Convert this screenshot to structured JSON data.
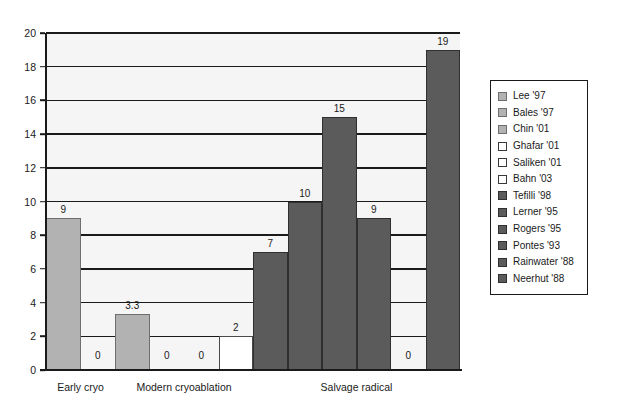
{
  "chart_data": {
    "type": "bar",
    "title": "",
    "subtitle": "",
    "xlabel": "",
    "ylabel": "",
    "ylim": [
      0,
      20
    ],
    "ytick_step": 2,
    "yticks": [
      "0",
      "2",
      "4",
      "6",
      "8",
      "10",
      "12",
      "14",
      "16",
      "18",
      "20"
    ],
    "grid": true,
    "grid_axis": "y",
    "legend_position": "right-outside",
    "categories": [
      "Early cryo",
      "Modern cryoablation",
      "Salvage radical"
    ],
    "category_spans": [
      {
        "label": "Early cryo",
        "bars": [
          0,
          1
        ]
      },
      {
        "label": "Modern cryoablation",
        "bars": [
          2,
          3,
          4,
          5
        ]
      },
      {
        "label": "Salvage radical",
        "bars": [
          6,
          7,
          8,
          9,
          10,
          11
        ]
      }
    ],
    "bars": [
      {
        "label": "Lee '97",
        "value": 9,
        "value_label": "9",
        "group": "Early cryo",
        "shade": "light"
      },
      {
        "label": "Bales '97",
        "value": 0,
        "value_label": "0",
        "group": "Early cryo",
        "shade": "light"
      },
      {
        "label": "Chin '01",
        "value": 3.3,
        "value_label": "3.3",
        "group": "Modern cryoablation",
        "shade": "light"
      },
      {
        "label": "Ghafar '01",
        "value": 0,
        "value_label": "0",
        "group": "Modern cryoablation",
        "shade": "white"
      },
      {
        "label": "Saliken '01",
        "value": 0,
        "value_label": "0",
        "group": "Modern cryoablation",
        "shade": "white"
      },
      {
        "label": "Bahn '03",
        "value": 2,
        "value_label": "2",
        "group": "Modern cryoablation",
        "shade": "white"
      },
      {
        "label": "Tefilli '98",
        "value": 7,
        "value_label": "7",
        "group": "Salvage radical",
        "shade": "dark"
      },
      {
        "label": "Lerner '95",
        "value": 10,
        "value_label": "10",
        "group": "Salvage radical",
        "shade": "dark"
      },
      {
        "label": "Rogers '95",
        "value": 15,
        "value_label": "15",
        "group": "Salvage radical",
        "shade": "dark"
      },
      {
        "label": "Pontes '93",
        "value": 9,
        "value_label": "9",
        "group": "Salvage radical",
        "shade": "dark"
      },
      {
        "label": "Rainwater '88",
        "value": 0,
        "value_label": "0",
        "group": "Salvage radical",
        "shade": "dark"
      },
      {
        "label": "Neerhut '88",
        "value": 19,
        "value_label": "19",
        "group": "Salvage radical",
        "shade": "dark"
      }
    ],
    "colors": {
      "light": "#b2b2b2",
      "white": "#ffffff",
      "dark": "#5b5b5b",
      "plot_background": "#f5f5f5",
      "axis": "#1a1a1a",
      "text": "#1a1a1a"
    }
  },
  "legend": {
    "items": [
      {
        "label": "Lee '97",
        "shade": "light"
      },
      {
        "label": "Bales '97",
        "shade": "light"
      },
      {
        "label": "Chin '01",
        "shade": "light"
      },
      {
        "label": "Ghafar '01",
        "shade": "white"
      },
      {
        "label": "Saliken '01",
        "shade": "white"
      },
      {
        "label": "Bahn '03",
        "shade": "white"
      },
      {
        "label": "Tefilli '98",
        "shade": "dark"
      },
      {
        "label": "Lerner '95",
        "shade": "dark"
      },
      {
        "label": "Rogers '95",
        "shade": "dark"
      },
      {
        "label": "Pontes '93",
        "shade": "dark"
      },
      {
        "label": "Rainwater '88",
        "shade": "dark"
      },
      {
        "label": "Neerhut '88",
        "shade": "dark"
      }
    ]
  }
}
